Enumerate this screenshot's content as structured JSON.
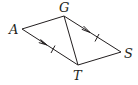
{
  "diagram": {
    "type": "geometry-figure",
    "points": [
      {
        "name": "A",
        "x": 22,
        "y": 29,
        "label_x": 9,
        "label_y": 34
      },
      {
        "name": "G",
        "x": 64,
        "y": 16,
        "label_x": 59,
        "label_y": 12
      },
      {
        "name": "S",
        "x": 121,
        "y": 52,
        "label_x": 124,
        "label_y": 58
      },
      {
        "name": "T",
        "x": 78,
        "y": 65,
        "label_x": 73,
        "label_y": 80
      }
    ],
    "segments": [
      {
        "from": "A",
        "to": "G",
        "marks": "none"
      },
      {
        "from": "G",
        "to": "S",
        "marks": "arrow+tick"
      },
      {
        "from": "S",
        "to": "T",
        "marks": "none"
      },
      {
        "from": "A",
        "to": "T",
        "marks": "arrow+tick"
      },
      {
        "from": "G",
        "to": "T",
        "marks": "none"
      }
    ],
    "annotations": {
      "parallel": [
        "AT",
        "GS"
      ],
      "congruent": [
        "AT",
        "GS"
      ]
    },
    "stroke_color": "#231f20"
  },
  "labels": {
    "A": "A",
    "G": "G",
    "S": "S",
    "T": "T"
  }
}
